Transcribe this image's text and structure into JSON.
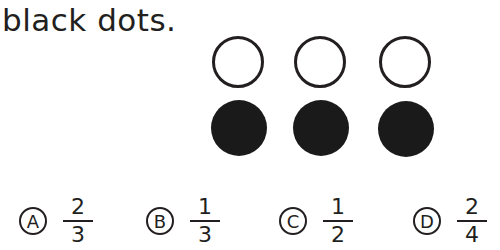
{
  "question": {
    "text": "black dots."
  },
  "dots": {
    "top_row": [
      "white",
      "white",
      "white"
    ],
    "bottom_row": [
      "black",
      "black",
      "black"
    ]
  },
  "options": [
    {
      "letter": "A",
      "numerator": "2",
      "denominator": "3"
    },
    {
      "letter": "B",
      "numerator": "1",
      "denominator": "3"
    },
    {
      "letter": "C",
      "numerator": "1",
      "denominator": "2"
    },
    {
      "letter": "D",
      "numerator": "2",
      "denominator": "4"
    }
  ]
}
